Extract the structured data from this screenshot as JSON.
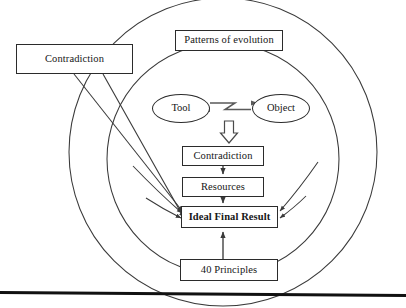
{
  "diagram": {
    "type": "concentric-circle-flow",
    "stroke_color": "#2b2b2b",
    "text_color": "#161616",
    "background": "#ffffff",
    "nodes": {
      "patterns_of_evolution": {
        "label": "Patterns of evolution",
        "shape": "rectangle"
      },
      "contradiction_outer": {
        "label": "Contradiction",
        "shape": "rectangle"
      },
      "tool": {
        "label": "Tool",
        "shape": "ellipse"
      },
      "object": {
        "label": "Object",
        "shape": "ellipse"
      },
      "contradiction_inner": {
        "label": "Contradiction",
        "shape": "rectangle"
      },
      "resources": {
        "label": "Resources",
        "shape": "rectangle"
      },
      "ideal_final_result": {
        "label": "Ideal Final Result",
        "shape": "rectangle"
      },
      "principles_40": {
        "label": "40 Principles",
        "shape": "rectangle"
      }
    },
    "rings": [
      {
        "name": "outer-circle",
        "cx": 223,
        "cy": 152,
        "r": 152
      },
      {
        "name": "inner-circle",
        "cx": 223,
        "cy": 158,
        "r": 112
      }
    ],
    "connectors": [
      {
        "from": "object",
        "to": "tool",
        "style": "double-headed-zigzag"
      },
      {
        "from": "tool-object-pair",
        "to": "contradiction_inner",
        "style": "hollow-block-arrow-down"
      },
      {
        "from": "contradiction_inner",
        "to": "resources",
        "style": "arrow-down"
      },
      {
        "from": "resources",
        "to": "ideal_final_result",
        "style": "arrow-down"
      },
      {
        "from": "principles_40",
        "to": "ideal_final_result",
        "style": "arrow-up"
      },
      {
        "from": "contradiction_outer",
        "to": "ideal_final_result",
        "style": "diagonal-arrow"
      },
      {
        "from": "contradiction_outer",
        "to": "ideal_final_result",
        "style": "diagonal-arrow"
      },
      {
        "from": "patterns_of_evolution",
        "to": "ideal_final_result",
        "style": "diagonal-arrow"
      },
      {
        "from": "patterns_of_evolution",
        "to": "ideal_final_result",
        "style": "diagonal-arrow"
      }
    ],
    "footer_rule": {
      "name": "bottom-rule",
      "thickness": 3
    }
  }
}
